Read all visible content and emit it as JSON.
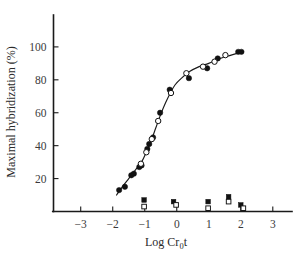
{
  "chart_data": {
    "type": "scatter",
    "title": "",
    "subtitle": "",
    "xlabel": "Log Cr₀t",
    "xlabel_parts": {
      "prefix": "Log Cr",
      "subscript": "0",
      "suffix": "t"
    },
    "ylabel": "Maximal hybridization (%)",
    "xlim": [
      -3.85,
      3.6
    ],
    "ylim": [
      0,
      112
    ],
    "xticks": [
      -3,
      -2,
      -1,
      0,
      1,
      2,
      3
    ],
    "xtick_labels": [
      "−3",
      "−2",
      "−1",
      "0",
      "1",
      "2",
      "3"
    ],
    "yticks": [
      20,
      40,
      60,
      80,
      100
    ],
    "ytick_labels": [
      "20",
      "40",
      "60",
      "80",
      "100"
    ],
    "grid": false,
    "legend": "none",
    "axis_color": "#1a1a1a",
    "marker_color": "#111111",
    "series": [
      {
        "name": "hybridization-filled-circles",
        "marker": "filled-circle",
        "points": [
          {
            "x": -1.8,
            "y": 13
          },
          {
            "x": -1.62,
            "y": 15
          },
          {
            "x": -1.42,
            "y": 22
          },
          {
            "x": -1.34,
            "y": 23
          },
          {
            "x": -1.17,
            "y": 27
          },
          {
            "x": -1.1,
            "y": 28
          },
          {
            "x": -0.92,
            "y": 38
          },
          {
            "x": -0.86,
            "y": 41
          },
          {
            "x": -0.74,
            "y": 45
          },
          {
            "x": -0.52,
            "y": 60
          },
          {
            "x": -0.22,
            "y": 74
          },
          {
            "x": 0.38,
            "y": 81
          },
          {
            "x": 0.95,
            "y": 87
          },
          {
            "x": 1.28,
            "y": 93
          },
          {
            "x": 1.92,
            "y": 97
          },
          {
            "x": 2.02,
            "y": 97
          }
        ]
      },
      {
        "name": "hybridization-open-circles",
        "marker": "open-circle",
        "points": [
          {
            "x": -1.12,
            "y": 29
          },
          {
            "x": -0.95,
            "y": 36
          },
          {
            "x": -0.78,
            "y": 44
          },
          {
            "x": -0.58,
            "y": 55
          },
          {
            "x": -0.18,
            "y": 72
          },
          {
            "x": 0.3,
            "y": 84
          },
          {
            "x": 0.82,
            "y": 88
          },
          {
            "x": 1.18,
            "y": 91
          },
          {
            "x": 1.52,
            "y": 95
          }
        ]
      },
      {
        "name": "control-filled-squares",
        "marker": "filled-square",
        "points": [
          {
            "x": -1.02,
            "y": 7
          },
          {
            "x": -0.1,
            "y": 6
          },
          {
            "x": 0.98,
            "y": 6
          },
          {
            "x": 1.62,
            "y": 9
          },
          {
            "x": 2.0,
            "y": 4
          }
        ]
      },
      {
        "name": "control-open-squares",
        "marker": "open-square",
        "points": [
          {
            "x": -1.02,
            "y": 3
          },
          {
            "x": -0.02,
            "y": 4
          },
          {
            "x": 0.98,
            "y": 2
          },
          {
            "x": 1.62,
            "y": 6
          },
          {
            "x": 2.08,
            "y": 2
          }
        ]
      }
    ],
    "fit_curve": {
      "name": "sigmoid-fit",
      "points": [
        {
          "x": -1.88,
          "y": 10
        },
        {
          "x": -1.7,
          "y": 15
        },
        {
          "x": -1.5,
          "y": 20
        },
        {
          "x": -1.3,
          "y": 25
        },
        {
          "x": -1.1,
          "y": 30
        },
        {
          "x": -0.95,
          "y": 36
        },
        {
          "x": -0.8,
          "y": 43
        },
        {
          "x": -0.65,
          "y": 51
        },
        {
          "x": -0.5,
          "y": 59
        },
        {
          "x": -0.35,
          "y": 66
        },
        {
          "x": -0.2,
          "y": 72
        },
        {
          "x": -0.05,
          "y": 77
        },
        {
          "x": 0.15,
          "y": 81
        },
        {
          "x": 0.4,
          "y": 85
        },
        {
          "x": 0.7,
          "y": 88
        },
        {
          "x": 1.0,
          "y": 90
        },
        {
          "x": 1.35,
          "y": 93
        },
        {
          "x": 1.7,
          "y": 95
        },
        {
          "x": 2.05,
          "y": 97
        }
      ]
    }
  }
}
